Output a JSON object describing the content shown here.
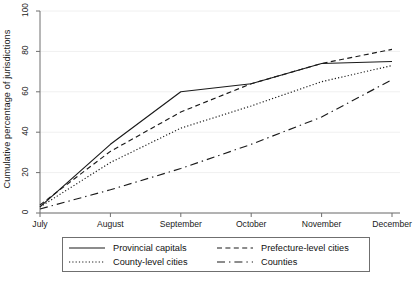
{
  "chart_data": {
    "type": "line",
    "title": "",
    "xlabel": "",
    "ylabel": "Cumulative percentage of jurisdictions",
    "categories": [
      "July",
      "August",
      "September",
      "October",
      "November",
      "December"
    ],
    "x_tick_labels": [
      "July",
      "August",
      "September",
      "October",
      "November",
      "December"
    ],
    "y_tick_labels": [
      "0",
      "20",
      "40",
      "60",
      "80",
      "100"
    ],
    "ylim": [
      0,
      100
    ],
    "grid": "horizontal",
    "legend_position": "below-plot",
    "series": [
      {
        "name": "Provincial capitals",
        "style": "solid",
        "values": [
          3,
          34,
          60,
          64,
          74,
          75
        ]
      },
      {
        "name": "County-level cities",
        "style": "dotted",
        "values": [
          3,
          25,
          42,
          53,
          65,
          73
        ]
      },
      {
        "name": "Prefecture-level cities",
        "style": "dashed",
        "values": [
          4,
          30.5,
          50,
          64,
          74,
          81
        ]
      },
      {
        "name": "Counties",
        "style": "long-dash-dot",
        "values": [
          2,
          11.5,
          22,
          34,
          47.5,
          66
        ]
      }
    ]
  },
  "axes": {
    "y_title": "Cumulative percentage of jurisdictions",
    "y_ticks": [
      "0",
      "20",
      "40",
      "60",
      "80",
      "100"
    ],
    "x_ticks": [
      "July",
      "August",
      "September",
      "October",
      "November",
      "December"
    ]
  },
  "legend": {
    "entries": [
      {
        "label": "Provincial capitals",
        "style": "solid"
      },
      {
        "label": "Prefecture-level cities",
        "style": "dashed"
      },
      {
        "label": "County-level cities",
        "style": "dotted"
      },
      {
        "label": "Counties",
        "style": "long-dash-dot"
      }
    ]
  },
  "colors": {
    "line": "#1a1a1a",
    "axis": "#6f6f6f",
    "grid": "#f0f0f0",
    "background": "#ffffff"
  }
}
